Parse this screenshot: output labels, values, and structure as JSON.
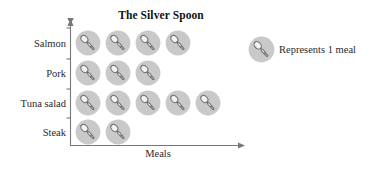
{
  "chart_data": {
    "type": "bar",
    "subtype": "pictograph",
    "title": "The Silver Spoon",
    "xlabel": "Meals",
    "ylabel": "",
    "orientation": "horizontal",
    "categories": [
      "Salmon",
      "Pork",
      "Tuna salad",
      "Steak"
    ],
    "values": [
      4,
      3,
      5,
      2
    ],
    "icon": "spoon-icon",
    "icon_unit_value": 1,
    "grid": false,
    "legend_position": "top-right",
    "legend": [
      {
        "icon": "spoon-icon",
        "label": "Represents 1 meal"
      }
    ],
    "rows": [
      {
        "category": "Salmon",
        "count": 4
      },
      {
        "category": "Pork",
        "count": 3
      },
      {
        "category": "Tuna salad",
        "count": 5
      },
      {
        "category": "Steak",
        "count": 2
      }
    ]
  },
  "colors": {
    "icon_fill": "#c9c9c9",
    "icon_stroke": "#8f8f8f",
    "spoon_fill": "#f2f2f2",
    "spoon_stroke": "#6e6e6e",
    "axis": "#777777",
    "text": "#2a2a2a",
    "title": "#111111",
    "background": "#ffffff"
  },
  "legend_text": "Represents 1 meal",
  "axis": {
    "x_label": "Meals",
    "y_tick_count": 5
  }
}
